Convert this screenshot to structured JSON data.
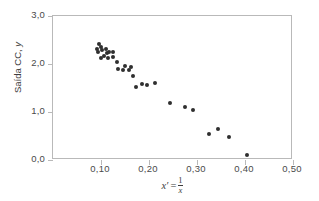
{
  "chart_data": {
    "type": "scatter",
    "title": "",
    "xlabel": "x' = 1/x",
    "ylabel": "Saída CC, y",
    "xlim": [
      0.0,
      0.5
    ],
    "ylim": [
      0.0,
      3.0
    ],
    "grid": false,
    "legend": null,
    "x_ticks": [
      "0,10",
      "0,20",
      "0,30",
      "0,40",
      "0,50"
    ],
    "x_tick_values": [
      0.1,
      0.2,
      0.3,
      0.4,
      0.5
    ],
    "y_ticks": [
      "0,0",
      "1,0",
      "2,0",
      "3,0"
    ],
    "y_tick_values": [
      0.0,
      1.0,
      2.0,
      3.0
    ],
    "marker_color": "#2f2f2f",
    "axis_color": "#b9b9b9",
    "points": [
      {
        "x": 0.092,
        "y": 2.32
      },
      {
        "x": 0.096,
        "y": 2.41
      },
      {
        "x": 0.094,
        "y": 2.24
      },
      {
        "x": 0.1,
        "y": 2.36
      },
      {
        "x": 0.103,
        "y": 2.29
      },
      {
        "x": 0.106,
        "y": 2.16
      },
      {
        "x": 0.1,
        "y": 2.12
      },
      {
        "x": 0.11,
        "y": 2.32
      },
      {
        "x": 0.113,
        "y": 2.22
      },
      {
        "x": 0.117,
        "y": 2.26
      },
      {
        "x": 0.114,
        "y": 2.13
      },
      {
        "x": 0.124,
        "y": 2.25
      },
      {
        "x": 0.126,
        "y": 2.15
      },
      {
        "x": 0.133,
        "y": 2.05
      },
      {
        "x": 0.136,
        "y": 1.89
      },
      {
        "x": 0.146,
        "y": 1.88
      },
      {
        "x": 0.15,
        "y": 1.96
      },
      {
        "x": 0.158,
        "y": 1.88
      },
      {
        "x": 0.163,
        "y": 1.94
      },
      {
        "x": 0.166,
        "y": 1.74
      },
      {
        "x": 0.172,
        "y": 1.53
      },
      {
        "x": 0.186,
        "y": 1.58
      },
      {
        "x": 0.196,
        "y": 1.57
      },
      {
        "x": 0.213,
        "y": 1.61
      },
      {
        "x": 0.243,
        "y": 1.18
      },
      {
        "x": 0.276,
        "y": 1.11
      },
      {
        "x": 0.291,
        "y": 1.05
      },
      {
        "x": 0.325,
        "y": 0.54
      },
      {
        "x": 0.343,
        "y": 0.64
      },
      {
        "x": 0.367,
        "y": 0.48
      },
      {
        "x": 0.405,
        "y": 0.11
      }
    ]
  },
  "axis_titles": {
    "y_text_main": "Saída CC, ",
    "y_text_italic": "y",
    "x_var": "x",
    "x_prime": "′",
    "x_equals": "=",
    "x_numerator": "1",
    "x_denominator": "x"
  }
}
